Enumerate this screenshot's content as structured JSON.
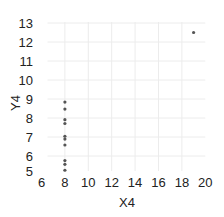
{
  "chart_data": {
    "type": "scatter",
    "title": "",
    "xlabel": "X4",
    "ylabel": "Y4",
    "xlim": [
      6,
      20
    ],
    "ylim": [
      5,
      13
    ],
    "xticks": [
      6,
      8,
      10,
      12,
      14,
      16,
      18,
      20
    ],
    "yticks": [
      5,
      6,
      7,
      8,
      9,
      10,
      11,
      12,
      13
    ],
    "grid": true,
    "legend": null,
    "series": [
      {
        "name": "Y4",
        "x": [
          8,
          8,
          8,
          8,
          8,
          8,
          8,
          19,
          8,
          8,
          8
        ],
        "y": [
          6.58,
          5.76,
          7.71,
          8.84,
          8.47,
          7.04,
          5.25,
          12.5,
          5.56,
          7.91,
          6.89
        ],
        "color": "#555555"
      }
    ]
  }
}
